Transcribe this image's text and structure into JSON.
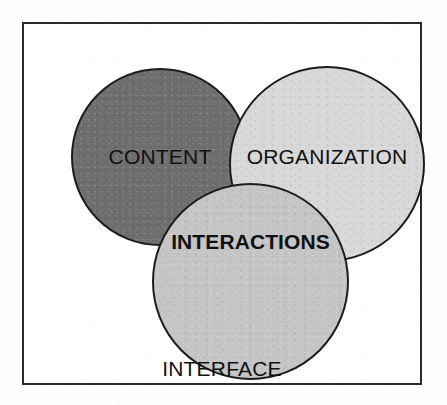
{
  "figure": {
    "type": "venn-diagram",
    "caption": "INTERFACE",
    "frame": {
      "border_color": "#2b2b2b",
      "background": "#ffffff"
    },
    "circles": [
      {
        "id": "content",
        "label": "CONTENT",
        "fill": "#6e6e6e",
        "stroke": "#1c1c1c",
        "bold": false,
        "stack_order": 1
      },
      {
        "id": "organization",
        "label": "ORGANIZATION",
        "fill": "#d8d8d8",
        "stroke": "#1c1c1c",
        "bold": false,
        "stack_order": 2
      },
      {
        "id": "interactions",
        "label": "INTERACTIONS",
        "fill": "#c5c5c5",
        "stroke": "#1c1c1c",
        "bold": true,
        "stack_order": 3
      }
    ]
  }
}
